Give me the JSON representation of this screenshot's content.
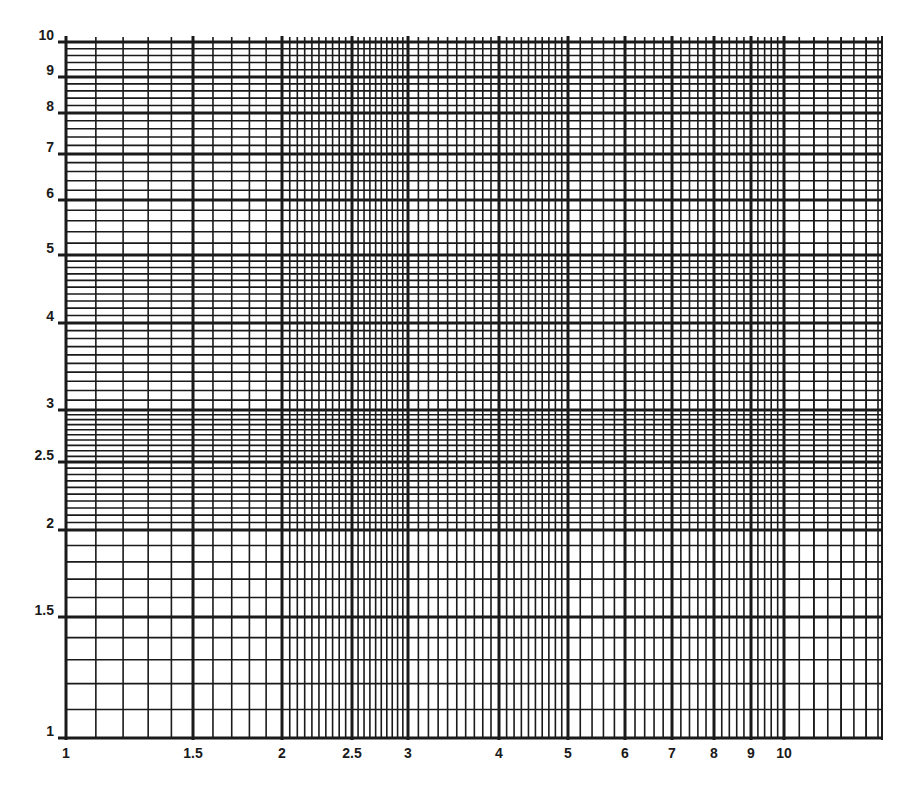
{
  "chart_data": {
    "type": "log-log graph paper",
    "title": "",
    "xlabel": "",
    "ylabel": "",
    "xscale": "log",
    "yscale": "log",
    "xlim": [
      1,
      13
    ],
    "ylim": [
      1,
      10
    ],
    "grid": true,
    "x_tick_labels": [
      "1",
      "1.5",
      "2",
      "2.5",
      "3",
      "4",
      "5",
      "6",
      "7",
      "8",
      "9",
      "10"
    ],
    "y_tick_labels": [
      "1",
      "1.5",
      "2",
      "2.5",
      "3",
      "4",
      "5",
      "6",
      "7",
      "8",
      "9",
      "10"
    ],
    "series": []
  },
  "axes": {
    "x": {
      "ticks": [
        {
          "value": 1,
          "label": "1",
          "px": 66
        },
        {
          "value": 1.5,
          "label": "1.5",
          "px": 193
        },
        {
          "value": 2,
          "label": "2",
          "px": 282
        },
        {
          "value": 2.5,
          "label": "2.5",
          "px": 352
        },
        {
          "value": 3,
          "label": "3",
          "px": 408
        },
        {
          "value": 4,
          "label": "4",
          "px": 499
        },
        {
          "value": 5,
          "label": "5",
          "px": 568
        },
        {
          "value": 6,
          "label": "6",
          "px": 625
        },
        {
          "value": 7,
          "label": "7",
          "px": 672
        },
        {
          "value": 8,
          "label": "8",
          "px": 714
        },
        {
          "value": 9,
          "label": "9",
          "px": 751
        },
        {
          "value": 10,
          "label": "10",
          "px": 784
        }
      ],
      "right_edge_px": 882
    },
    "y": {
      "ticks": [
        {
          "value": 1,
          "label": "1",
          "px": 738
        },
        {
          "value": 1.5,
          "label": "1.5",
          "px": 617
        },
        {
          "value": 2,
          "label": "2",
          "px": 530
        },
        {
          "value": 2.5,
          "label": "2.5",
          "px": 462
        },
        {
          "value": 3,
          "label": "3",
          "px": 410
        },
        {
          "value": 4,
          "label": "4",
          "px": 323
        },
        {
          "value": 5,
          "label": "5",
          "px": 255
        },
        {
          "value": 6,
          "label": "6",
          "px": 200
        },
        {
          "value": 7,
          "label": "7",
          "px": 154
        },
        {
          "value": 8,
          "label": "8",
          "px": 113
        },
        {
          "value": 9,
          "label": "9",
          "px": 77
        },
        {
          "value": 10,
          "label": "10",
          "px": 42
        }
      ]
    }
  },
  "colors": {
    "grid": "#1a1a1a",
    "background": "#ffffff"
  }
}
